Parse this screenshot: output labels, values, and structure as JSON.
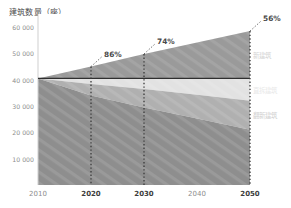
{
  "chart_data": {
    "type": "area",
    "title": "建筑数量（座）",
    "ylabel": "建筑数量（座）",
    "xlabel": "",
    "x": [
      2010,
      2020,
      2030,
      2040,
      2050
    ],
    "xlim": [
      2010,
      2050
    ],
    "ylim": [
      0,
      65000
    ],
    "yticks": [
      10000,
      20000,
      30000,
      40000,
      50000,
      60000
    ],
    "ytick_labels": [
      "10 000",
      "20 000",
      "30 000",
      "40 000",
      "50 000",
      "60 000"
    ],
    "xtick_labels": [
      "2010",
      "2020",
      "2030",
      "2040",
      "2050"
    ],
    "xtick_bold": [
      false,
      true,
      true,
      false,
      true
    ],
    "grid": false,
    "legend_position": "right",
    "baseline_value": 40500,
    "series": [
      {
        "name": "新建筑",
        "color": "#9a9a9a",
        "label_color": "#d3d3d3",
        "stack": "above",
        "lower": [
          40500,
          40500,
          40500,
          40500,
          40500
        ],
        "upper": [
          40500,
          45000,
          49800,
          54200,
          58500
        ]
      },
      {
        "name": "直拆建筑",
        "color": "#e2e2e2",
        "label_color": "#e8e8e8",
        "stack": "below",
        "upper": [
          40500,
          40500,
          40500,
          40500,
          40500
        ],
        "lower": [
          40500,
          38400,
          36500,
          34300,
          32000
        ]
      },
      {
        "name": "翻新建筑",
        "color": "#b0b0b0",
        "label_color": "#cfcfcf",
        "stack": "below",
        "upper": [
          40500,
          38400,
          36500,
          34300,
          32000
        ],
        "lower": [
          40500,
          34000,
          29500,
          25300,
          21000
        ]
      },
      {
        "name": "现有建筑",
        "color": "#8e8e8e",
        "label_color": "#ffffff",
        "stack": "below",
        "upper": [
          40500,
          34000,
          29500,
          25300,
          21000
        ],
        "lower": [
          0,
          0,
          0,
          0,
          0
        ]
      }
    ],
    "annotations": [
      {
        "label": "86%",
        "x": 2020,
        "value": 45000
      },
      {
        "label": "74%",
        "x": 2030,
        "value": 49800
      },
      {
        "label": "56%",
        "x": 2050,
        "value": 58500
      }
    ],
    "marker_years": [
      2020,
      2030,
      2050
    ]
  }
}
